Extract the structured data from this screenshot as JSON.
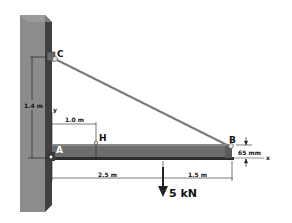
{
  "figure": {
    "points": {
      "A": "A",
      "B": "B",
      "C": "C",
      "H": "H"
    },
    "dimensions": {
      "wall_height": "1.4 m",
      "AH": "1.0 m",
      "A_to_load": "2.5 m",
      "load_to_B": "1.5 m",
      "beam_depth": "65 mm"
    },
    "axes": {
      "x": "x",
      "y": "y"
    },
    "load": {
      "label": "5 kN",
      "direction": "down"
    },
    "colors": {
      "wall_front": "#8a8a8a",
      "wall_side": "#4a4a4a",
      "beam": "#6e6e6e",
      "beam_edge": "#2e2e2e",
      "cable": "#7a7a7a",
      "dim_line": "#333333"
    }
  }
}
